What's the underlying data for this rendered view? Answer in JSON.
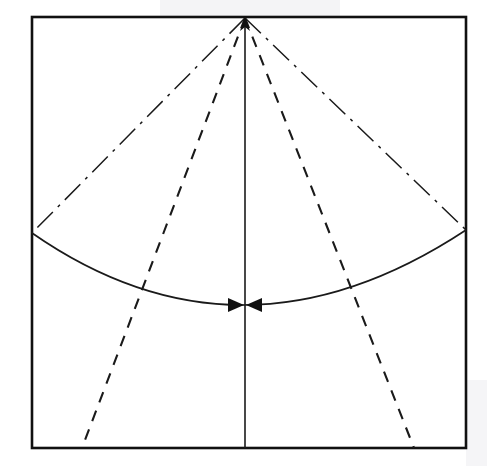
{
  "figure": {
    "canvas": {
      "width": 487,
      "height": 466
    },
    "background_color": "#ffffff",
    "stroke_color": "#1a1a1a"
  },
  "frame": {
    "name": "bounding-rectangle",
    "x": 32,
    "y": 17,
    "width": 434,
    "height": 431,
    "stroke_width": 2.6,
    "stroke_color": "#111111"
  },
  "apex": {
    "label": "apex-vertex",
    "x": 245,
    "y": 18,
    "arrow_direction": "up"
  },
  "axis_line": {
    "name": "vertical-center-axis",
    "style": "solid",
    "x1": 245,
    "y1": 18,
    "x2": 245,
    "y2": 448,
    "stroke_width": 1.6
  },
  "radius_lines": [
    {
      "name": "left-radius-dashdot",
      "style": "dash-dot",
      "x1": 245,
      "y1": 18,
      "x2": 32,
      "y2": 233,
      "dash_pattern": "22 7 3 7",
      "stroke_width": 1.5
    },
    {
      "name": "right-radius-dashdot",
      "style": "dash-dot",
      "x1": 245,
      "y1": 18,
      "x2": 466,
      "y2": 230,
      "dash_pattern": "22 7 3 7",
      "stroke_width": 1.5
    }
  ],
  "arc": {
    "name": "spherical-cap-arc",
    "style": "solid",
    "start_x": 32,
    "start_y": 233,
    "end_x": 466,
    "end_y": 230,
    "mid_x": 245,
    "mid_y": 305,
    "stroke_width": 1.7
  },
  "dashed_rays": [
    {
      "name": "left-dashed-ray",
      "style": "dashed",
      "x1": 245,
      "y1": 18,
      "x2": 82,
      "y2": 448,
      "dash_pattern": "11 9",
      "stroke_width": 2.1
    },
    {
      "name": "right-dashed-ray",
      "style": "dashed",
      "x1": 245,
      "y1": 18,
      "x2": 414,
      "y2": 448,
      "dash_pattern": "11 9",
      "stroke_width": 2.1
    }
  ],
  "arc_arrowheads": [
    {
      "name": "arc-arrowhead-left",
      "tip_x": 245,
      "tip_y": 305,
      "points_toward": "center-right",
      "size": 16
    },
    {
      "name": "arc-arrowhead-right",
      "tip_x": 245,
      "tip_y": 305,
      "points_toward": "center-left",
      "size": 16
    }
  ]
}
